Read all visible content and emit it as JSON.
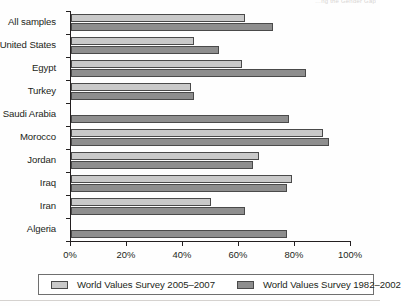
{
  "running_head": "…ng the Gender Gap",
  "chart_data": {
    "type": "bar",
    "orientation": "horizontal",
    "title": "",
    "subtitle": "",
    "xlabel": "",
    "ylabel": "",
    "xlim": [
      0,
      100
    ],
    "xticks": [
      "0%",
      "20%",
      "40%",
      "60%",
      "80%",
      "100%"
    ],
    "xtick_values": [
      0,
      20,
      40,
      60,
      80,
      100
    ],
    "grid": false,
    "legend_position": "bottom",
    "categories": [
      "All samples",
      "United States",
      "Egypt",
      "Turkey",
      "Saudi Arabia",
      "Morocco",
      "Jordan",
      "Iraq",
      "Iran",
      "Algeria"
    ],
    "series": [
      {
        "name": "World Values Survey 2005–2007",
        "color": "#c9c9c9",
        "values": [
          62,
          44,
          61,
          43,
          null,
          90,
          67,
          79,
          50,
          null
        ]
      },
      {
        "name": "World Values Survey 1982–2002",
        "color": "#8e8e8e",
        "values": [
          72,
          53,
          84,
          44,
          78,
          92,
          65,
          77,
          62,
          77
        ]
      }
    ]
  },
  "legend": {
    "items": [
      {
        "label": "World Values Survey 2005–2007",
        "swatch": "light-gray-swatch"
      },
      {
        "label": "World Values Survey 1982–2002",
        "swatch": "dark-gray-swatch"
      }
    ]
  }
}
